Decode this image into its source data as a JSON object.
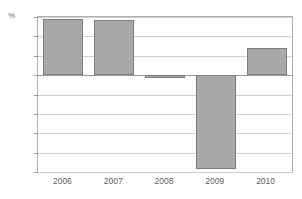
{
  "title_remnant": "····· ·· ·· ··· ·· ···",
  "unit_label": "%",
  "chart_data": {
    "type": "bar",
    "title": "",
    "xlabel": "",
    "ylabel": "%",
    "categories": [
      "2006",
      "2007",
      "2008",
      "2009",
      "2010"
    ],
    "values": [
      2.9,
      2.85,
      -0.1,
      -4.85,
      1.4
    ],
    "ylim": [
      -5,
      3
    ],
    "ytick_labels": [
      "3",
      "2",
      "1",
      "0",
      "-1",
      "-2",
      "-3",
      "-4",
      "-5"
    ],
    "ytick_values": [
      3,
      2,
      1,
      0,
      -1,
      -2,
      -3,
      -4,
      -5
    ],
    "grid": true,
    "legend": "none",
    "bar_color": "#a8a8a8",
    "bar_border_color": "#7d7d7d",
    "gridline_color": "#cfcfcf",
    "zero_line_color": "#9a9a9a",
    "frame_color": "#b0b0b0",
    "background_color": "#ffffff"
  }
}
